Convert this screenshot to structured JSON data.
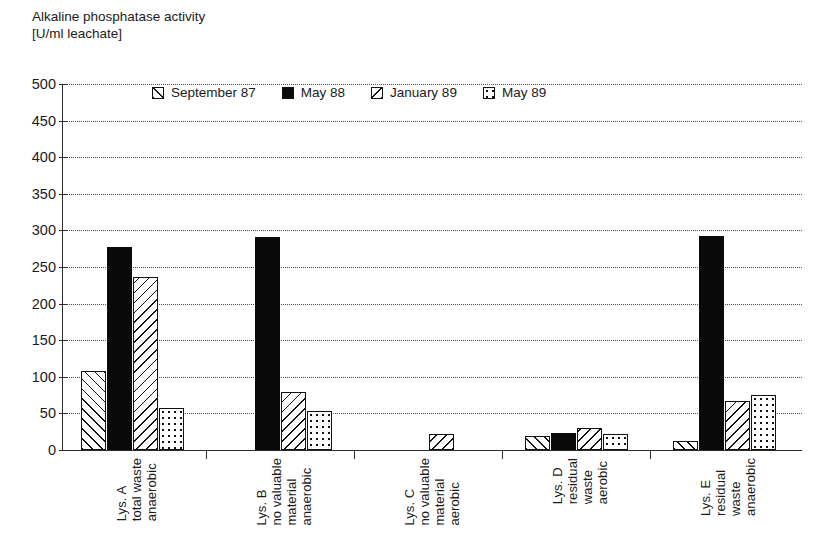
{
  "title": {
    "line1": "Alkaline phosphatase activity",
    "line2": "[U/ml leachate]"
  },
  "legend": {
    "items": [
      {
        "label": "September 87",
        "pattern": "back-hatch"
      },
      {
        "label": "May 88",
        "pattern": "solid-black"
      },
      {
        "label": "January 89",
        "pattern": "forward-hatch"
      },
      {
        "label": "May 89",
        "pattern": "dotted"
      }
    ]
  },
  "axes": {
    "y_ticks": [
      "500",
      "450",
      "400",
      "350",
      "300",
      "250",
      "200",
      "150",
      "100",
      "50",
      "0"
    ],
    "y_min": 0,
    "y_max": 500,
    "y_step": 50
  },
  "categories": [
    {
      "id": "lys-a",
      "lines": [
        "Lys. A",
        "total waste",
        "anaerobic"
      ]
    },
    {
      "id": "lys-b",
      "lines": [
        "Lys. B",
        "no valuable",
        "material",
        "anaerobic"
      ]
    },
    {
      "id": "lys-c",
      "lines": [
        "Lys. C",
        "no valuable",
        "material",
        "aerobic"
      ]
    },
    {
      "id": "lys-d",
      "lines": [
        "Lys. D",
        "residual",
        "waste",
        "aerobic"
      ]
    },
    {
      "id": "lys-e",
      "lines": [
        "Lys. E",
        "residual",
        "waste",
        "anaerobic"
      ]
    }
  ],
  "chart_data": {
    "type": "bar",
    "title": "Alkaline phosphatase activity [U/ml leachate]",
    "xlabel": "",
    "ylabel": "Alkaline phosphatase activity [U/ml leachate]",
    "ylim": [
      0,
      500
    ],
    "ytick_step": 50,
    "grid": true,
    "legend_position": "top-inside",
    "categories": [
      "Lys. A total waste anaerobic",
      "Lys. B no valuable material anaerobic",
      "Lys. C no valuable material aerobic",
      "Lys. D residual waste aerobic",
      "Lys. E residual waste anaerobic"
    ],
    "series": [
      {
        "name": "September 87",
        "pattern": "back-hatch",
        "values": [
          108,
          0,
          0,
          19,
          12
        ]
      },
      {
        "name": "May 88",
        "pattern": "solid-black",
        "values": [
          278,
          291,
          0,
          23,
          293
        ]
      },
      {
        "name": "January 89",
        "pattern": "forward-hatch",
        "values": [
          237,
          79,
          22,
          30,
          67
        ]
      },
      {
        "name": "May 89",
        "pattern": "dotted",
        "values": [
          58,
          53,
          0,
          22,
          75
        ]
      }
    ]
  },
  "colors": {
    "ink": "#111111",
    "axis": "#2b2b2b",
    "grid": "#4a4a4a",
    "background": "#ffffff"
  }
}
